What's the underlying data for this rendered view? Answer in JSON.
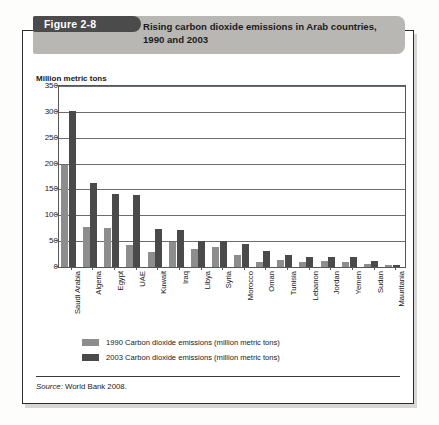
{
  "figure": {
    "tab_label": "Figure 2-8",
    "source_label": "Source:",
    "source_text": " World Bank 2008."
  },
  "legend": {
    "items": [
      {
        "label": "1990 Carbon dioxide emissions (million metric tons)",
        "color": "#8d8d8d"
      },
      {
        "label": "2003 Carbon dioxide emissions (million metric tons)",
        "color": "#4a4a4a"
      }
    ]
  },
  "chart_data": {
    "type": "bar",
    "xlabel": "",
    "ylabel": "Million metric tons",
    "ylim": [
      0,
      350
    ],
    "yticks": [
      0,
      50,
      100,
      150,
      200,
      250,
      300,
      350
    ],
    "grid": true,
    "legend_position": "below",
    "categories": [
      "Saudi Arabia",
      "Algeria",
      "Egypt",
      "UAE",
      "Kuwait",
      "Iraq",
      "Libya",
      "Syria",
      "Morocco",
      "Oman",
      "Tunisia",
      "Lebanon",
      "Jordan",
      "Yemen",
      "Sudan",
      "Mauritania"
    ],
    "series": [
      {
        "name": "1990 Carbon dioxide emissions (million metric tons)",
        "color": "#8d8d8d",
        "values": [
          198,
          77,
          75,
          42,
          29,
          48,
          35,
          38,
          23,
          10,
          13,
          9,
          11,
          10,
          5,
          3
        ]
      },
      {
        "name": "2003 Carbon dioxide emissions (million metric tons)",
        "color": "#4a4a4a",
        "values": [
          302,
          163,
          142,
          139,
          74,
          72,
          51,
          50,
          44,
          31,
          23,
          20,
          19,
          20,
          11,
          3
        ]
      }
    ]
  },
  "colors": {
    "banner": "#b9b7b4",
    "tab": "#4b4b4b",
    "axis": "#55585b",
    "grid": "#6a6d70",
    "page": "#fdfdfc"
  }
}
